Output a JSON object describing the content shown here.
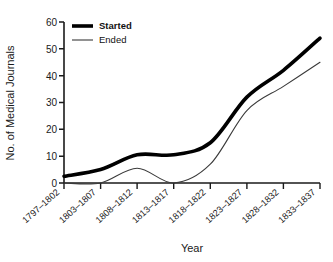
{
  "chart_data": {
    "type": "line",
    "title": "",
    "xlabel": "Year",
    "ylabel": "No. of Medical Journals",
    "categories": [
      "1797–1802",
      "1803–1807",
      "1808–1812",
      "1813–1817",
      "1818–1822",
      "1823–1827",
      "1828–1832",
      "1833–1837"
    ],
    "series": [
      {
        "name": "Started",
        "values": [
          2.5,
          5,
          10.5,
          10.5,
          15,
          32,
          42,
          54
        ],
        "style": "thick"
      },
      {
        "name": "Ended",
        "values": [
          0,
          0,
          5.5,
          0,
          7,
          27,
          36,
          45
        ],
        "style": "thin"
      }
    ],
    "ylim": [
      0,
      60
    ],
    "yticks": [
      0,
      10,
      20,
      30,
      40,
      50,
      60
    ],
    "grid": false,
    "legend_position": "top-left",
    "legend": [
      "Started",
      "Ended"
    ],
    "colors": {
      "started": "#000000",
      "ended": "#3a3a3a",
      "axis": "#1a1a1a",
      "background": "#ffffff"
    }
  }
}
